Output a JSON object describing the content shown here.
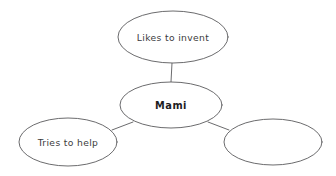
{
  "diagram": {
    "type": "bubble-map",
    "background_color": "#ffffff",
    "stroke_color": "#5a5a5c",
    "text_color": "#3b3b3d",
    "center_text_color": "#1d1d1f",
    "center": {
      "label": "Mami",
      "cx": 171,
      "cy": 105,
      "rx": 51,
      "ry": 23
    },
    "nodes": [
      {
        "id": "likes-to-invent",
        "label": "Likes to invent",
        "cx": 173,
        "cy": 37,
        "rx": 55,
        "ry": 26,
        "empty": false
      },
      {
        "id": "tries-to-help",
        "label": "Tries to help",
        "cx": 68,
        "cy": 142,
        "rx": 49,
        "ry": 24,
        "empty": false
      },
      {
        "id": "blank-bubble",
        "label": "",
        "cx": 273,
        "cy": 142,
        "rx": 49,
        "ry": 23,
        "empty": true
      }
    ],
    "connectors": [
      {
        "id": "connector-center-to-top",
        "x1": 172,
        "y1": 63,
        "x2": 171,
        "y2": 82
      },
      {
        "id": "connector-center-to-left",
        "x1": 133,
        "y1": 122,
        "x2": 112,
        "y2": 130
      },
      {
        "id": "connector-center-to-right",
        "x1": 208,
        "y1": 122,
        "x2": 229,
        "y2": 130
      }
    ]
  }
}
